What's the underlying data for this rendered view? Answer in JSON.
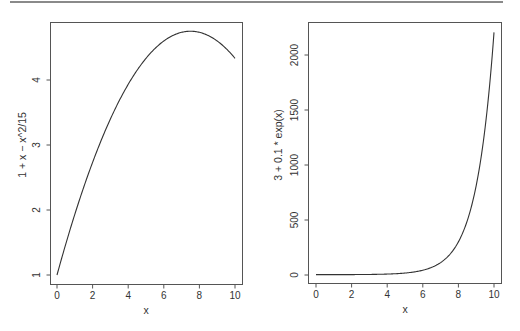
{
  "chart_data": [
    {
      "type": "line",
      "title": "",
      "xlabel": "x",
      "ylabel": "1 + x − x^2/15",
      "function": "1 + x - x^2/15",
      "xlim": [
        0,
        10
      ],
      "ylim": [
        1,
        4.75
      ],
      "x_ticks": [
        0,
        2,
        4,
        6,
        8,
        10
      ],
      "x_tick_labels": [
        "0",
        "2",
        "4",
        "6",
        "8",
        "10"
      ],
      "y_ticks": [
        1,
        2,
        3,
        4
      ],
      "y_tick_labels": [
        "1",
        "2",
        "3",
        "4"
      ],
      "grid": false,
      "series": [
        {
          "name": "1 + x - x^2/15",
          "x": [
            0,
            1,
            2,
            3,
            4,
            5,
            6,
            7,
            7.5,
            8,
            9,
            10
          ],
          "y": [
            1.0,
            1.933,
            2.733,
            3.4,
            3.933,
            4.333,
            4.6,
            4.733,
            4.75,
            4.733,
            4.6,
            4.333
          ]
        }
      ]
    },
    {
      "type": "line",
      "title": "",
      "xlabel": "x",
      "ylabel": "3 + 0.1 * exp(x)",
      "function": "3 + 0.1 * exp(x)",
      "xlim": [
        0,
        10
      ],
      "ylim": [
        0,
        2200
      ],
      "x_ticks": [
        0,
        2,
        4,
        6,
        8,
        10
      ],
      "x_tick_labels": [
        "0",
        "2",
        "4",
        "6",
        "8",
        "10"
      ],
      "y_ticks": [
        0,
        500,
        1000,
        1500,
        2000
      ],
      "y_tick_labels": [
        "0",
        "500",
        "1000",
        "1500",
        "2000"
      ],
      "grid": false,
      "series": [
        {
          "name": "3 + 0.1 * exp(x)",
          "x": [
            0,
            2,
            4,
            5,
            6,
            7,
            8,
            9,
            9.5,
            10
          ],
          "y": [
            3.1,
            3.74,
            8.46,
            17.84,
            43.34,
            112.66,
            301.1,
            813.08,
            1339.9,
            2205.5
          ]
        }
      ]
    }
  ]
}
